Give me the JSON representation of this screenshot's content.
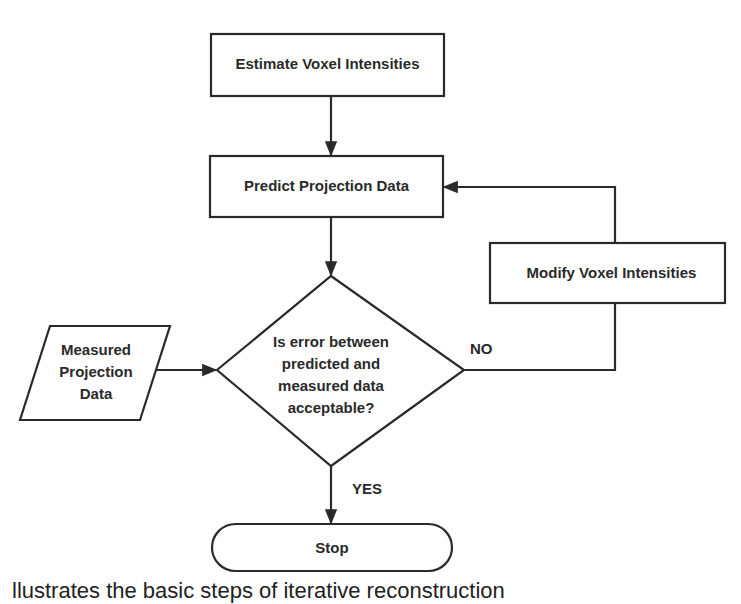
{
  "diagram": {
    "type": "flowchart",
    "nodes": {
      "estimate": {
        "label": "Estimate Voxel Intensities",
        "shape": "rectangle"
      },
      "predict": {
        "label": "Predict Projection Data",
        "shape": "rectangle"
      },
      "decision": {
        "lines": [
          "Is error between",
          "predicted and",
          "measured data",
          "acceptable?"
        ],
        "shape": "diamond"
      },
      "measured": {
        "lines": [
          "Measured",
          "Projection",
          "Data"
        ],
        "shape": "parallelogram"
      },
      "modify": {
        "label": "Modify Voxel Intensities",
        "shape": "rectangle"
      },
      "stop": {
        "label": "Stop",
        "shape": "terminator"
      }
    },
    "edges": [
      {
        "from": "estimate",
        "to": "predict",
        "label": ""
      },
      {
        "from": "predict",
        "to": "decision",
        "label": ""
      },
      {
        "from": "measured",
        "to": "decision",
        "label": ""
      },
      {
        "from": "decision",
        "to": "modify",
        "label": "NO"
      },
      {
        "from": "modify",
        "to": "predict",
        "label": ""
      },
      {
        "from": "decision",
        "to": "stop",
        "label": "YES"
      }
    ],
    "edge_labels": {
      "no": "NO",
      "yes": "YES"
    },
    "colors": {
      "stroke": "#2a2a2a",
      "text": "#2a2a2a",
      "background": "#ffffff"
    }
  },
  "caption": "llustrates the basic steps of iterative reconstruction"
}
